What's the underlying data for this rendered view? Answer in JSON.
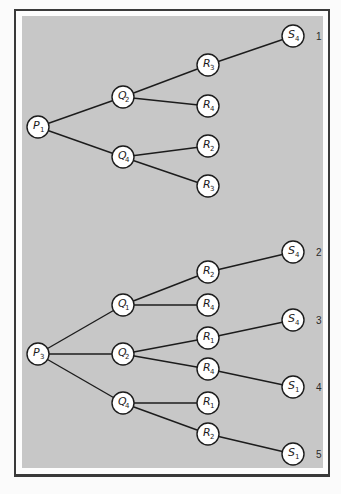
{
  "diagram": {
    "type": "tree",
    "colors": {
      "panel": "#c7c7c7",
      "frame": "#3a3a3a",
      "node_fill": "#ffffff",
      "line": "#1c1c1c"
    },
    "node_radius": 11,
    "trees": [
      {
        "root": "P1",
        "nodes": [
          {
            "id": "t1_P1",
            "letter": "P",
            "sub": "1",
            "x": 38,
            "y": 127
          },
          {
            "id": "t1_Q2",
            "letter": "Q",
            "sub": "2",
            "x": 123,
            "y": 97
          },
          {
            "id": "t1_Q4",
            "letter": "Q",
            "sub": "4",
            "x": 123,
            "y": 157
          },
          {
            "id": "t1_R3a",
            "letter": "R",
            "sub": "3",
            "x": 208,
            "y": 65
          },
          {
            "id": "t1_R4",
            "letter": "R",
            "sub": "4",
            "x": 208,
            "y": 106
          },
          {
            "id": "t1_R2",
            "letter": "R",
            "sub": "2",
            "x": 208,
            "y": 146
          },
          {
            "id": "t1_R3b",
            "letter": "R",
            "sub": "3",
            "x": 208,
            "y": 186
          },
          {
            "id": "t1_S4",
            "letter": "S",
            "sub": "4",
            "x": 293,
            "y": 36
          }
        ],
        "edges": [
          [
            "t1_P1",
            "t1_Q2"
          ],
          [
            "t1_P1",
            "t1_Q4"
          ],
          [
            "t1_Q2",
            "t1_R3a"
          ],
          [
            "t1_Q2",
            "t1_R4"
          ],
          [
            "t1_Q4",
            "t1_R2"
          ],
          [
            "t1_Q4",
            "t1_R3b"
          ],
          [
            "t1_R3a",
            "t1_S4"
          ]
        ],
        "path_labels": [
          {
            "text": "1",
            "x": 316,
            "y": 36
          }
        ]
      },
      {
        "root": "P3",
        "nodes": [
          {
            "id": "t2_P3",
            "letter": "P",
            "sub": "3",
            "x": 38,
            "y": 354
          },
          {
            "id": "t2_Q1",
            "letter": "Q",
            "sub": "1",
            "x": 123,
            "y": 305
          },
          {
            "id": "t2_Q2",
            "letter": "Q",
            "sub": "2",
            "x": 123,
            "y": 354
          },
          {
            "id": "t2_Q4",
            "letter": "Q",
            "sub": "4",
            "x": 123,
            "y": 403
          },
          {
            "id": "t2_R2a",
            "letter": "R",
            "sub": "2",
            "x": 208,
            "y": 272
          },
          {
            "id": "t2_R4a",
            "letter": "R",
            "sub": "4",
            "x": 208,
            "y": 305
          },
          {
            "id": "t2_R1a",
            "letter": "R",
            "sub": "1",
            "x": 208,
            "y": 338
          },
          {
            "id": "t2_R4b",
            "letter": "R",
            "sub": "4",
            "x": 208,
            "y": 369
          },
          {
            "id": "t2_R1b",
            "letter": "R",
            "sub": "1",
            "x": 208,
            "y": 403
          },
          {
            "id": "t2_R2b",
            "letter": "R",
            "sub": "2",
            "x": 208,
            "y": 434
          },
          {
            "id": "t2_S4a",
            "letter": "S",
            "sub": "4",
            "x": 293,
            "y": 252
          },
          {
            "id": "t2_S4b",
            "letter": "S",
            "sub": "4",
            "x": 293,
            "y": 320
          },
          {
            "id": "t2_S1a",
            "letter": "S",
            "sub": "1",
            "x": 293,
            "y": 387
          },
          {
            "id": "t2_S1b",
            "letter": "S",
            "sub": "1",
            "x": 293,
            "y": 454
          }
        ],
        "edges": [
          [
            "t2_P3",
            "t2_Q1"
          ],
          [
            "t2_P3",
            "t2_Q2"
          ],
          [
            "t2_P3",
            "t2_Q4"
          ],
          [
            "t2_Q1",
            "t2_R2a"
          ],
          [
            "t2_Q1",
            "t2_R4a"
          ],
          [
            "t2_Q2",
            "t2_R1a"
          ],
          [
            "t2_Q2",
            "t2_R4b"
          ],
          [
            "t2_Q4",
            "t2_R1b"
          ],
          [
            "t2_Q4",
            "t2_R2b"
          ],
          [
            "t2_R2a",
            "t2_S4a"
          ],
          [
            "t2_R1a",
            "t2_S4b"
          ],
          [
            "t2_R4b",
            "t2_S1a"
          ],
          [
            "t2_R2b",
            "t2_S1b"
          ]
        ],
        "path_labels": [
          {
            "text": "2",
            "x": 316,
            "y": 252
          },
          {
            "text": "3",
            "x": 316,
            "y": 320
          },
          {
            "text": "4",
            "x": 316,
            "y": 387
          },
          {
            "text": "5",
            "x": 316,
            "y": 454
          }
        ]
      }
    ]
  }
}
